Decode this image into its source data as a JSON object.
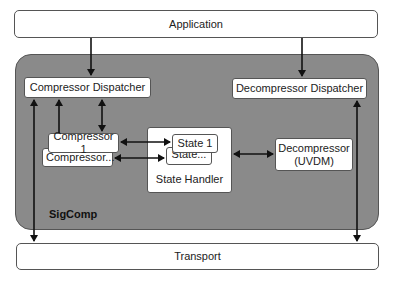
{
  "diagram": {
    "application": "Application",
    "transport": "Transport",
    "sigcomp": {
      "label": "SigComp",
      "compressor_dispatcher": "Compressor Dispatcher",
      "decompressor_dispatcher": "Decompressor Dispatcher",
      "compressor_1": "Compressor 1",
      "compressor_n": "Compressor...",
      "state_handler": "State Handler",
      "state_1": "State 1",
      "state_n": "State...",
      "decompressor_line1": "Decompressor",
      "decompressor_line2": "(UVDM)"
    },
    "colors": {
      "container_fill": "#8a8a8a",
      "box_fill": "#ffffff",
      "arrow": "#111111"
    }
  }
}
